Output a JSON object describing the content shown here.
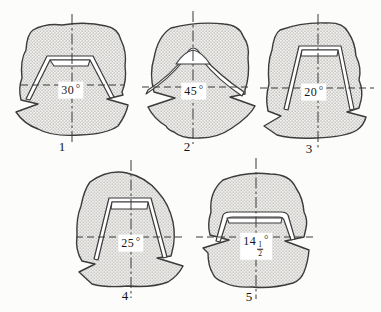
{
  "colors": {
    "line": "#3b3b3b",
    "stipple_dot": "#a3a3a0",
    "stipple_background": "#f2f1ef",
    "paper": "#fcfcfa",
    "label_background": "#ffffff"
  },
  "figures": [
    {
      "number": "1",
      "angle": {
        "whole": "30",
        "deg": "°"
      }
    },
    {
      "number": "2",
      "angle": {
        "whole": "45",
        "deg": "°"
      }
    },
    {
      "number": "3",
      "angle": {
        "whole": "20",
        "deg": "°"
      }
    },
    {
      "number": "4",
      "angle": {
        "whole": "25",
        "deg": "°"
      }
    },
    {
      "number": "5",
      "angle": {
        "whole": "14",
        "num": "1",
        "den": "2",
        "deg": "°"
      }
    }
  ]
}
